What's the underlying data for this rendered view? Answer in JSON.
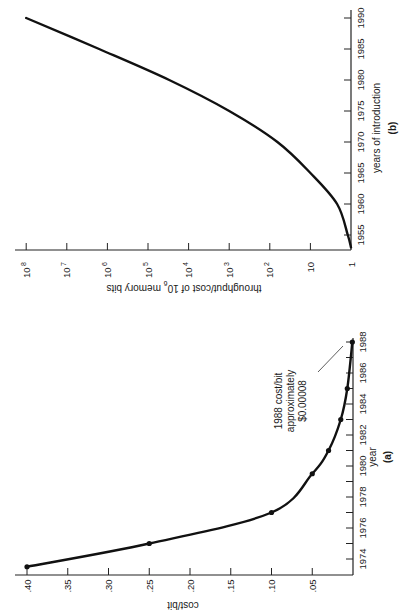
{
  "chart_data": [
    {
      "id": "a",
      "type": "line",
      "panel_label": "(a)",
      "title": "",
      "xlabel": "year",
      "ylabel": "cost/bit",
      "x_ticks": [
        "1974",
        "1976",
        "1978",
        "1980",
        "1982",
        "1984",
        "1986",
        "1988"
      ],
      "y_ticks": [
        ".40",
        ".35",
        ".30",
        ".25",
        ".20",
        ".15",
        ".10",
        ".05"
      ],
      "xlim": [
        1973,
        1988
      ],
      "ylim": [
        0,
        0.4
      ],
      "grid": false,
      "markers": true,
      "orientation": "rotated 90° counter-clockwise on page",
      "series": [
        {
          "name": "cost/bit",
          "x": [
            1973.5,
            1975,
            1977,
            1979.5,
            1981,
            1983,
            1985,
            1988
          ],
          "values": [
            0.4,
            0.25,
            0.1,
            0.05,
            0.03,
            0.015,
            0.007,
            0.0008
          ]
        }
      ],
      "annotations": [
        {
          "text_lines": [
            "1988 cost/bit",
            "approximately",
            "$0.00008"
          ],
          "points_to": {
            "x": 1988,
            "y": 0.0008
          }
        }
      ]
    },
    {
      "id": "b",
      "type": "line",
      "panel_label": "(b)",
      "title": "",
      "xlabel": "years of introduction",
      "ylabel": "throughput/cost of 10^6 memory bits",
      "ylabel_parts": {
        "before": "throughput/cost of 10",
        "sup": "6",
        "after": " memory bits"
      },
      "x_ticks": [
        "1955",
        "1960",
        "1965",
        "1970",
        "1975",
        "1980",
        "1985",
        "1990"
      ],
      "y_ticks": [
        {
          "base": "1",
          "exp": ""
        },
        {
          "base": "10",
          "exp": ""
        },
        {
          "base": "10",
          "exp": "2"
        },
        {
          "base": "10",
          "exp": "3"
        },
        {
          "base": "10",
          "exp": "4"
        },
        {
          "base": "10",
          "exp": "5"
        },
        {
          "base": "10",
          "exp": "6"
        },
        {
          "base": "10",
          "exp": "7"
        },
        {
          "base": "10",
          "exp": "8"
        }
      ],
      "y_scale": "log",
      "xlim": [
        1953,
        1990
      ],
      "ylim": [
        1,
        100000000
      ],
      "grid": false,
      "markers": false,
      "orientation": "rotated 90° counter-clockwise on page",
      "series": [
        {
          "name": "throughput/cost",
          "x": [
            1953,
            1955,
            1960,
            1965,
            1970,
            1975,
            1980,
            1985,
            1990
          ],
          "values": [
            1,
            1.2,
            2.2,
            10,
            65,
            1000,
            30000,
            1600000,
            100000000
          ]
        }
      ]
    }
  ]
}
